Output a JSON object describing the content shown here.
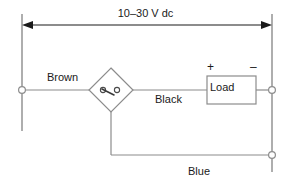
{
  "diagram": {
    "supply": {
      "label": "10–30 V dc",
      "arrow_left": "left-arrowhead",
      "arrow_right": "right-arrowhead"
    },
    "conductors": [
      {
        "name": "brown-wire",
        "label": "Brown"
      },
      {
        "name": "black-wire",
        "label": "Black"
      },
      {
        "name": "blue-wire",
        "label": "Blue"
      }
    ],
    "load": {
      "label": "Load",
      "polarity_positive": "+",
      "polarity_negative": "–"
    },
    "switch": {
      "name": "normally-open-contact",
      "shape": "diamond"
    },
    "terminals": [
      {
        "name": "terminal-left-supply"
      },
      {
        "name": "terminal-right-load"
      },
      {
        "name": "terminal-right-return"
      }
    ],
    "colors": {
      "wire": "#8c8c8c",
      "dimension": "#1a1a1a",
      "text": "#1a1a1a",
      "background": "#ffffff"
    }
  }
}
